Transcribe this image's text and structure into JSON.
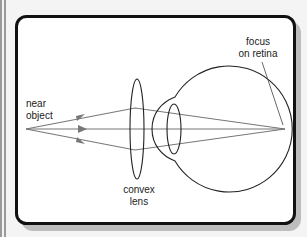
{
  "diagram": {
    "labels": {
      "object": [
        "near",
        "object"
      ],
      "lens": [
        "convex",
        "lens"
      ],
      "focus": [
        "focus",
        "on retina"
      ]
    },
    "colors": {
      "frame": "#111111",
      "shadow": "#bdbdbd",
      "rays": "#777777",
      "outline": "#222222",
      "background": "#ffffff",
      "side_bars": "#9a9a9a"
    },
    "geometry": {
      "object_point": [
        26,
        129
      ],
      "convex_lens": {
        "cx": 137,
        "cy": 129,
        "rx": 7,
        "ry": 50
      },
      "eye_lens": {
        "cx": 174,
        "cy": 129,
        "rx": 7,
        "ry": 25
      },
      "focus_point": [
        285,
        129
      ],
      "rays": 3
    }
  }
}
